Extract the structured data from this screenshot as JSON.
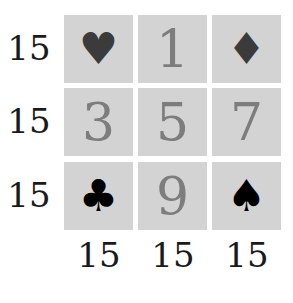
{
  "puzzle": {
    "row_sums": [
      "15",
      "15",
      "15"
    ],
    "col_sums": [
      "15",
      "15",
      "15"
    ],
    "grid": [
      [
        {
          "type": "suit",
          "value": "♥",
          "name": "heart"
        },
        {
          "type": "number",
          "value": "1"
        },
        {
          "type": "suit",
          "value": "♦",
          "name": "diamond"
        }
      ],
      [
        {
          "type": "number",
          "value": "3"
        },
        {
          "type": "number",
          "value": "5"
        },
        {
          "type": "number",
          "value": "7"
        }
      ],
      [
        {
          "type": "suit",
          "value": "♣",
          "name": "club"
        },
        {
          "type": "number",
          "value": "9"
        },
        {
          "type": "suit",
          "value": "♠",
          "name": "spade"
        }
      ]
    ]
  },
  "colors": {
    "cell_bg": "#d3d3d3",
    "number": "#7d7d7d",
    "suit_dark": "#3b3b3b",
    "suit_black": "#000000",
    "sum_text": "#1a1a1a"
  }
}
